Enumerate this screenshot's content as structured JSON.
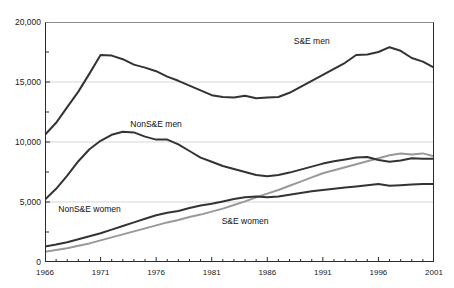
{
  "chart_data": {
    "type": "line",
    "title": "",
    "xlabel": "",
    "ylabel": "",
    "xlim": [
      1966,
      2001
    ],
    "ylim": [
      0,
      20000
    ],
    "grid": "horizontal",
    "legend_position": "inline-annotations",
    "x": [
      1966,
      1967,
      1968,
      1969,
      1970,
      1971,
      1972,
      1973,
      1974,
      1975,
      1976,
      1977,
      1978,
      1979,
      1980,
      1981,
      1982,
      1983,
      1984,
      1985,
      1986,
      1987,
      1988,
      1989,
      1990,
      1991,
      1992,
      1993,
      1994,
      1995,
      1996,
      1997,
      1998,
      1999,
      2000,
      2001
    ],
    "yticks": [
      0,
      5000,
      10000,
      15000,
      20000
    ],
    "ytick_labels": [
      "0",
      "5,000",
      "10,000",
      "15,000",
      "20,000"
    ],
    "xticks": [
      1966,
      1971,
      1976,
      1981,
      1986,
      1991,
      1996,
      2001
    ],
    "xtick_labels": [
      "1966",
      "1971",
      "1976",
      "1981",
      "1986",
      "1991",
      "1996",
      "2001"
    ],
    "series": [
      {
        "name": "S&E men",
        "color": "#333333",
        "width": 2.0,
        "label_x": 1990,
        "label_y": 18300,
        "values": [
          10600,
          11600,
          12900,
          14200,
          15700,
          17250,
          17200,
          16900,
          16450,
          16200,
          15900,
          15450,
          15100,
          14700,
          14300,
          13900,
          13750,
          13700,
          13850,
          13650,
          13700,
          13750,
          14100,
          14600,
          15100,
          15600,
          16100,
          16600,
          17250,
          17300,
          17500,
          17900,
          17600,
          17000,
          16700,
          16200
        ]
      },
      {
        "name": "NonS&E men",
        "color": "#333333",
        "width": 2.0,
        "label_x": 1976,
        "label_y": 11400,
        "values": [
          5200,
          6100,
          7200,
          8400,
          9400,
          10100,
          10600,
          10850,
          10800,
          10450,
          10200,
          10200,
          9800,
          9250,
          8700,
          8350,
          8000,
          7750,
          7500,
          7250,
          7150,
          7250,
          7450,
          7700,
          7950,
          8200,
          8400,
          8550,
          8700,
          8750,
          8500,
          8350,
          8450,
          8650,
          8600,
          8600
        ]
      },
      {
        "name": "NonS&E women",
        "color": "#333333",
        "width": 2.0,
        "label_x": 1970,
        "label_y": 4300,
        "values": [
          1300,
          1450,
          1650,
          1900,
          2150,
          2400,
          2700,
          3000,
          3300,
          3600,
          3900,
          4100,
          4250,
          4500,
          4700,
          4850,
          5050,
          5250,
          5400,
          5450,
          5400,
          5450,
          5600,
          5750,
          5900,
          6000,
          6100,
          6200,
          6300,
          6400,
          6500,
          6350,
          6400,
          6450,
          6500,
          6500
        ]
      },
      {
        "name": "S&E women",
        "color": "#999999",
        "width": 2.0,
        "label_x": 1984,
        "label_y": 3300,
        "values": [
          850,
          1000,
          1150,
          1350,
          1550,
          1800,
          2050,
          2300,
          2550,
          2800,
          3050,
          3300,
          3500,
          3750,
          3950,
          4200,
          4450,
          4750,
          5050,
          5400,
          5700,
          6000,
          6350,
          6700,
          7050,
          7400,
          7650,
          7900,
          8150,
          8400,
          8650,
          8900,
          9050,
          8950,
          9050,
          8800
        ]
      }
    ]
  }
}
